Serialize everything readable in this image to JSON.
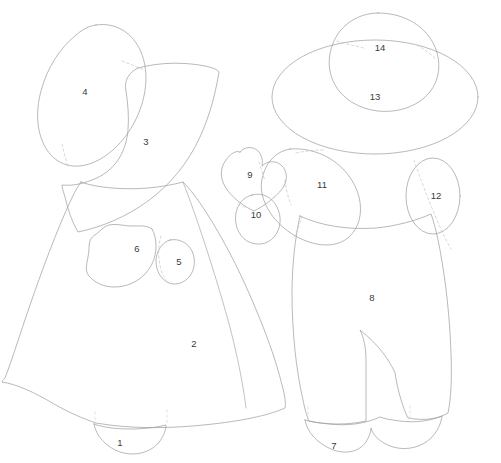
{
  "document": {
    "kind": "applique-pattern-sheet",
    "title": "",
    "canvas": {
      "width": 501,
      "height": 463
    },
    "background_color": "#ffffff",
    "outline_color": "#9b9b9e",
    "dashed_seam_color": "#c4c4c8",
    "label_color": "#3a3a3a"
  },
  "figures": [
    {
      "name": "bonnet-girl",
      "label": "",
      "pieces": [
        "1",
        "2",
        "3",
        "4",
        "5",
        "6"
      ]
    },
    {
      "name": "hat-boy",
      "label": "",
      "pieces": [
        "7",
        "8",
        "9",
        "10",
        "11",
        "12",
        "13",
        "14"
      ]
    }
  ],
  "pieces": [
    {
      "id": "1",
      "label": "1",
      "name": "girl-shoe",
      "x": 120,
      "y": 443
    },
    {
      "id": "2",
      "label": "2",
      "name": "girl-dress",
      "x": 194,
      "y": 344
    },
    {
      "id": "3",
      "label": "3",
      "name": "girl-bodice-cape",
      "x": 146,
      "y": 142
    },
    {
      "id": "4",
      "label": "4",
      "name": "girl-bonnet",
      "x": 85,
      "y": 92
    },
    {
      "id": "5",
      "label": "5",
      "name": "girl-hand",
      "x": 179,
      "y": 262
    },
    {
      "id": "6",
      "label": "6",
      "name": "girl-basket",
      "x": 137,
      "y": 249
    },
    {
      "id": "7",
      "label": "7",
      "name": "boy-shoes",
      "x": 334,
      "y": 446
    },
    {
      "id": "8",
      "label": "8",
      "name": "boy-overalls",
      "x": 372,
      "y": 298
    },
    {
      "id": "9",
      "label": "9",
      "name": "boy-heart",
      "x": 250,
      "y": 175
    },
    {
      "id": "10",
      "label": "10",
      "name": "boy-hand",
      "x": 256,
      "y": 215
    },
    {
      "id": "11",
      "label": "11",
      "name": "boy-arm-sleeve",
      "x": 322,
      "y": 185
    },
    {
      "id": "12",
      "label": "12",
      "name": "boy-back-arm",
      "x": 436,
      "y": 196
    },
    {
      "id": "13",
      "label": "13",
      "name": "boy-hat-brim",
      "x": 375,
      "y": 97
    },
    {
      "id": "14",
      "label": "14",
      "name": "boy-hat-crown",
      "x": 380,
      "y": 48
    }
  ]
}
